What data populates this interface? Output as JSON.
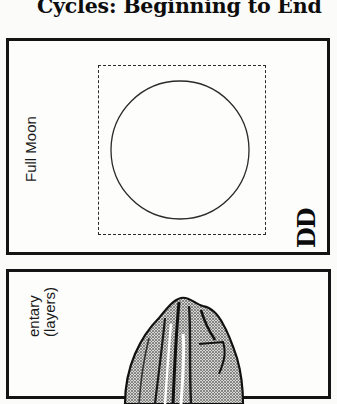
{
  "page": {
    "title": "Cycles: Beginning to End"
  },
  "cards": [
    {
      "label": "Full Moon",
      "code": "DD",
      "graphic": "circle-in-dashed-box"
    },
    {
      "label_line1": "entary",
      "label_line2": "(layers)",
      "graphic": "sedimentary-rock-illustration"
    }
  ],
  "colors": {
    "ink": "#141414",
    "paper": "#fbfbfa"
  }
}
